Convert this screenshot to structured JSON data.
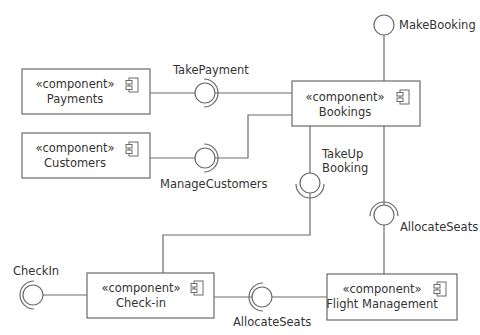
{
  "diagram": {
    "type": "UML component diagram",
    "stereotype": "«component»",
    "components": [
      {
        "id": "payments",
        "name": "Payments"
      },
      {
        "id": "customers",
        "name": "Customers"
      },
      {
        "id": "bookings",
        "name": "Bookings"
      },
      {
        "id": "checkin",
        "name": "Check-in"
      },
      {
        "id": "flight",
        "name": "Flight Management"
      }
    ],
    "interfaces": {
      "make_booking": "MakeBooking",
      "take_payment": "TakePayment",
      "manage_customers": "ManageCustomers",
      "take_up_booking_line1": "TakeUp",
      "take_up_booking_line2": "Booking",
      "allocate_seats_vertical": "AllocateSeats",
      "allocate_seats_horizontal": "AllocateSeats",
      "check_in": "CheckIn"
    },
    "connections": [
      {
        "from": "Payments",
        "interface": "TakePayment",
        "to": "Bookings"
      },
      {
        "from": "Customers",
        "interface": "ManageCustomers",
        "to": "Bookings"
      },
      {
        "from": "Bookings",
        "interface": "MakeBooking",
        "provided": true
      },
      {
        "from": "Bookings",
        "interface": "TakeUp Booking",
        "to": "Check-in"
      },
      {
        "from": "Flight Management",
        "interface": "AllocateSeats",
        "to": "Bookings"
      },
      {
        "from": "Flight Management",
        "interface": "AllocateSeats",
        "to": "Check-in"
      },
      {
        "from": "Check-in",
        "interface": "CheckIn",
        "required": true
      }
    ]
  }
}
